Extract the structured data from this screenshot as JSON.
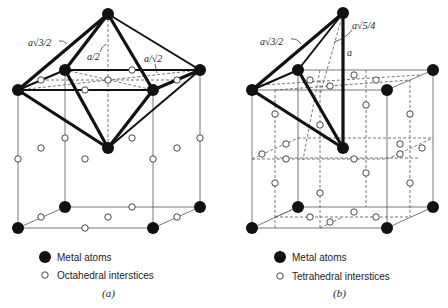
{
  "figure": {
    "panels": [
      {
        "id": "a",
        "caption": "(a)",
        "dimension_labels": [
          "a√3/2",
          "a/2",
          "a/√2"
        ],
        "legend": {
          "atom_label": "Metal atoms",
          "interstice_label": "Octahedral interstices"
        }
      },
      {
        "id": "b",
        "caption": "(b)",
        "dimension_labels": [
          "a√3/2",
          "a√5/4",
          "a"
        ],
        "legend": {
          "atom_label": "Metal atoms",
          "interstice_label": "Tetrahedral interstices"
        }
      }
    ],
    "colors": {
      "atom": "#111111",
      "interstice_fill": "#ffffff",
      "lines": "#555555"
    }
  }
}
